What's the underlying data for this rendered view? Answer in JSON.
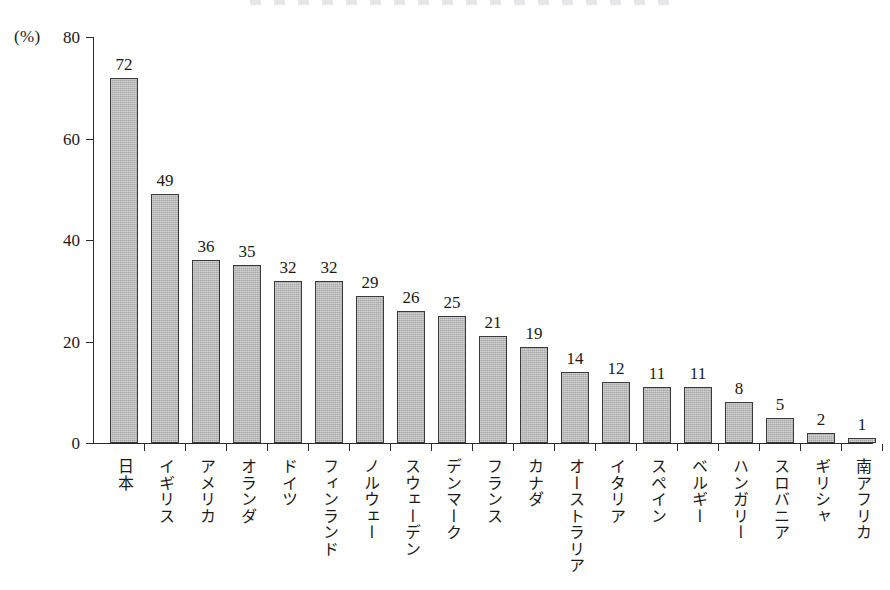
{
  "chart_data": {
    "type": "bar",
    "title": "",
    "subtitle": "",
    "xlabel": "",
    "ylabel": "",
    "unit_label": "(%)",
    "ylim": [
      0,
      80
    ],
    "yticks": [
      0,
      20,
      40,
      60,
      80
    ],
    "ytick_labels": [
      "0",
      "20",
      "40",
      "60",
      "80"
    ],
    "grid": false,
    "legend": false,
    "orientation": "vertical",
    "bar_fill_color": "#a8a8a8",
    "bar_border_color": "#3a3a3a",
    "axis_color": "#2b2b2b",
    "categories": [
      "日本",
      "イギリス",
      "アメリカ",
      "オランダ",
      "ドイツ",
      "フィンランド",
      "ノルウェー",
      "スウェーデン",
      "デンマーク",
      "フランス",
      "カナダ",
      "オーストラリア",
      "イタリア",
      "スペイン",
      "ベルギー",
      "ハンガリー",
      "スロバニア",
      "ギリシャ",
      "南アフリカ"
    ],
    "values": [
      72,
      49,
      36,
      35,
      32,
      32,
      29,
      26,
      25,
      21,
      19,
      14,
      12,
      11,
      11,
      8,
      5,
      2,
      1
    ],
    "value_labels": [
      "72",
      "49",
      "36",
      "35",
      "32",
      "32",
      "29",
      "26",
      "25",
      "21",
      "19",
      "14",
      "12",
      "11",
      "11",
      "8",
      "5",
      "2",
      "1"
    ]
  }
}
